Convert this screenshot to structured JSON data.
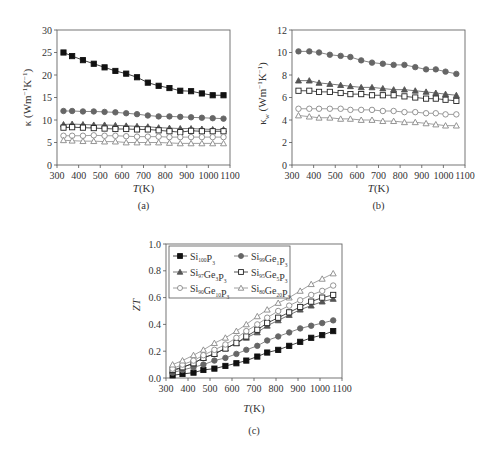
{
  "figure": {
    "panels": [
      "a",
      "b",
      "c"
    ]
  },
  "legend": {
    "entries": [
      {
        "base": "Si",
        "sub1": "100",
        "mid": "",
        "sub2": "",
        "tail": "P",
        "sub3": "3",
        "marker": "filled-square"
      },
      {
        "base": "Si",
        "sub1": "99",
        "mid": "Ge",
        "sub2": "1",
        "tail": "P",
        "sub3": "3",
        "marker": "filled-circle"
      },
      {
        "base": "Si",
        "sub1": "97",
        "mid": "Ge",
        "sub2": "3",
        "tail": "P",
        "sub3": "3",
        "marker": "filled-triangle"
      },
      {
        "base": "Si",
        "sub1": "95",
        "mid": "Ge",
        "sub2": "5",
        "tail": "P",
        "sub3": "3",
        "marker": "open-square"
      },
      {
        "base": "Si",
        "sub1": "90",
        "mid": "Ge",
        "sub2": "10",
        "tail": "P",
        "sub3": "3",
        "marker": "open-circle"
      },
      {
        "base": "Si",
        "sub1": "80",
        "mid": "Ge",
        "sub2": "20",
        "tail": "P",
        "sub3": "3",
        "marker": "open-triangle"
      }
    ]
  },
  "chart_data": [
    {
      "panel": "a",
      "caption": "(a)",
      "type": "line",
      "title": "",
      "xlabel": "T(K)",
      "ylabel": "κ (Wm⁻¹K⁻¹)",
      "xlim": [
        300,
        1100
      ],
      "ylim": [
        0,
        30
      ],
      "xticks": [
        300,
        400,
        500,
        600,
        700,
        800,
        900,
        1000,
        1100
      ],
      "yticks": [
        0,
        5,
        10,
        15,
        20,
        25,
        30
      ],
      "grid": false,
      "x": [
        330,
        370,
        420,
        470,
        520,
        570,
        620,
        670,
        720,
        770,
        820,
        870,
        920,
        970,
        1020,
        1070
      ],
      "series": [
        {
          "name": "Si100P3",
          "marker": "filled-square",
          "values": [
            25.0,
            24.2,
            23.3,
            22.5,
            21.7,
            20.9,
            20.3,
            19.5,
            18.3,
            17.6,
            17.1,
            16.5,
            16.4,
            15.9,
            15.5,
            15.5
          ]
        },
        {
          "name": "Si99Ge1P3",
          "marker": "filled-circle",
          "values": [
            12.0,
            12.0,
            11.9,
            11.9,
            11.8,
            11.7,
            11.5,
            11.3,
            11.0,
            10.8,
            10.8,
            10.7,
            10.6,
            10.5,
            10.4,
            10.3
          ]
        },
        {
          "name": "Si97Ge3P3",
          "marker": "filled-triangle",
          "values": [
            9.0,
            9.1,
            9.0,
            8.9,
            8.9,
            8.8,
            8.7,
            8.6,
            8.5,
            8.3,
            8.2,
            8.1,
            8.1,
            8.0,
            7.9,
            7.9
          ]
        },
        {
          "name": "Si95Ge5P3",
          "marker": "open-square",
          "values": [
            8.3,
            8.4,
            8.3,
            8.2,
            8.1,
            8.0,
            8.0,
            7.9,
            7.9,
            7.7,
            7.5,
            7.3,
            7.6,
            7.5,
            7.5,
            7.5
          ]
        },
        {
          "name": "Si90Ge10P3",
          "marker": "open-circle",
          "values": [
            6.5,
            6.5,
            6.5,
            6.6,
            6.5,
            6.5,
            6.4,
            6.3,
            6.3,
            6.3,
            6.2,
            6.2,
            6.2,
            6.2,
            6.2,
            6.2
          ]
        },
        {
          "name": "Si80Ge20P3",
          "marker": "open-triangle",
          "values": [
            5.5,
            5.4,
            5.3,
            5.3,
            5.2,
            5.2,
            5.0,
            5.0,
            5.0,
            5.0,
            4.9,
            4.8,
            4.8,
            4.8,
            4.8,
            4.8
          ]
        }
      ]
    },
    {
      "panel": "b",
      "caption": "(b)",
      "type": "line",
      "title": "",
      "xlabel": "T(K)",
      "ylabel": "κ_w (Wm⁻¹K⁻¹)",
      "xlim": [
        300,
        1100
      ],
      "ylim": [
        0,
        12
      ],
      "xticks": [
        300,
        400,
        500,
        600,
        700,
        800,
        900,
        1000,
        1100
      ],
      "yticks": [
        0,
        2,
        4,
        6,
        8,
        10,
        12
      ],
      "grid": false,
      "x": [
        330,
        380,
        425,
        475,
        525,
        570,
        620,
        670,
        720,
        770,
        820,
        870,
        920,
        965,
        1010,
        1060
      ],
      "series": [
        {
          "name": "Si99Ge1P3",
          "marker": "filled-circle",
          "values": [
            10.1,
            10.1,
            10.0,
            9.8,
            9.7,
            9.6,
            9.3,
            9.1,
            9.0,
            8.9,
            8.9,
            8.7,
            8.5,
            8.5,
            8.3,
            8.1
          ]
        },
        {
          "name": "Si97Ge3P3",
          "marker": "filled-triangle",
          "values": [
            7.5,
            7.5,
            7.3,
            7.2,
            7.1,
            7.0,
            6.9,
            6.9,
            6.8,
            6.7,
            6.7,
            6.6,
            6.5,
            6.4,
            6.3,
            6.2
          ]
        },
        {
          "name": "Si95Ge5P3",
          "marker": "open-square",
          "values": [
            6.6,
            6.6,
            6.5,
            6.5,
            6.4,
            6.3,
            6.3,
            6.2,
            6.2,
            6.2,
            6.1,
            6.0,
            5.9,
            5.9,
            5.8,
            5.7
          ]
        },
        {
          "name": "Si90Ge10P3",
          "marker": "open-circle",
          "values": [
            5.0,
            5.0,
            5.0,
            5.0,
            5.0,
            4.9,
            4.9,
            4.9,
            4.8,
            4.8,
            4.7,
            4.7,
            4.6,
            4.6,
            4.5,
            4.5
          ]
        },
        {
          "name": "Si80Ge20P3",
          "marker": "open-triangle",
          "values": [
            4.4,
            4.3,
            4.2,
            4.2,
            4.1,
            4.1,
            4.0,
            4.0,
            3.9,
            3.9,
            3.8,
            3.8,
            3.7,
            3.6,
            3.5,
            3.5
          ]
        }
      ]
    },
    {
      "panel": "c",
      "caption": "(c)",
      "type": "line",
      "title": "",
      "xlabel": "T(K)",
      "ylabel": "ZT",
      "xlim": [
        300,
        1100
      ],
      "ylim": [
        0,
        1.0
      ],
      "xticks": [
        300,
        400,
        500,
        600,
        700,
        800,
        900,
        1000,
        1100
      ],
      "yticks": [
        0.0,
        0.2,
        0.4,
        0.6,
        0.8,
        1.0
      ],
      "grid": false,
      "legend_position": "upper-left",
      "x": [
        330,
        375,
        425,
        470,
        520,
        570,
        620,
        665,
        715,
        760,
        810,
        860,
        910,
        960,
        1010,
        1060
      ],
      "series": [
        {
          "name": "Si100P3",
          "marker": "filled-square",
          "values": [
            0.02,
            0.03,
            0.04,
            0.06,
            0.07,
            0.09,
            0.11,
            0.13,
            0.16,
            0.19,
            0.21,
            0.24,
            0.27,
            0.3,
            0.32,
            0.35
          ]
        },
        {
          "name": "Si99Ge1P3",
          "marker": "filled-circle",
          "values": [
            0.04,
            0.06,
            0.08,
            0.1,
            0.13,
            0.15,
            0.18,
            0.21,
            0.24,
            0.28,
            0.31,
            0.34,
            0.37,
            0.39,
            0.41,
            0.43
          ]
        },
        {
          "name": "Si97Ge3P3",
          "marker": "filled-triangle",
          "values": [
            0.05,
            0.08,
            0.11,
            0.15,
            0.18,
            0.22,
            0.26,
            0.3,
            0.34,
            0.39,
            0.43,
            0.47,
            0.51,
            0.54,
            0.57,
            0.59
          ]
        },
        {
          "name": "Si95Ge5P3",
          "marker": "open-square",
          "values": [
            0.06,
            0.08,
            0.11,
            0.15,
            0.18,
            0.22,
            0.26,
            0.31,
            0.36,
            0.41,
            0.45,
            0.49,
            0.53,
            0.57,
            0.6,
            0.62
          ]
        },
        {
          "name": "Si90Ge10P3",
          "marker": "open-circle",
          "values": [
            0.07,
            0.1,
            0.13,
            0.17,
            0.21,
            0.25,
            0.3,
            0.35,
            0.4,
            0.45,
            0.5,
            0.54,
            0.58,
            0.62,
            0.65,
            0.69
          ]
        },
        {
          "name": "Si80Ge20P3",
          "marker": "open-triangle",
          "values": [
            0.1,
            0.13,
            0.17,
            0.21,
            0.26,
            0.3,
            0.35,
            0.4,
            0.46,
            0.51,
            0.56,
            0.6,
            0.65,
            0.7,
            0.74,
            0.78
          ]
        }
      ]
    }
  ]
}
